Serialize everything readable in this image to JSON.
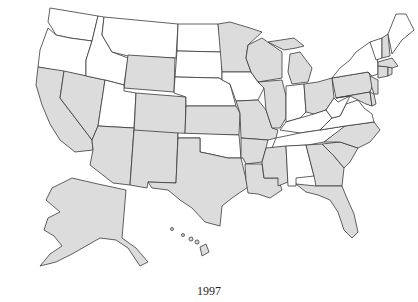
{
  "caption": "1997",
  "colors": {
    "shaded": "#dcdcdc",
    "unshaded": "#ffffff",
    "border": "#3a3a3a"
  },
  "legend": {
    "shaded_meaning": "shaded",
    "unshaded_meaning": "not shaded"
  },
  "states": {
    "shaded": [
      "CA",
      "NV",
      "WY",
      "CO",
      "AZ",
      "NM",
      "KS",
      "TX",
      "MN",
      "WI",
      "MI",
      "IL",
      "MO",
      "AR",
      "LA",
      "MS",
      "OH",
      "PA",
      "NJ",
      "MD",
      "DE",
      "NC",
      "SC",
      "GA",
      "FL",
      "NH",
      "MA",
      "CT",
      "RI",
      "AK",
      "HI"
    ],
    "unshaded": [
      "WA",
      "OR",
      "ID",
      "MT",
      "UT",
      "ND",
      "SD",
      "NE",
      "OK",
      "IA",
      "IN",
      "KY",
      "TN",
      "WV",
      "VA",
      "AL",
      "NY",
      "VT",
      "ME"
    ]
  }
}
